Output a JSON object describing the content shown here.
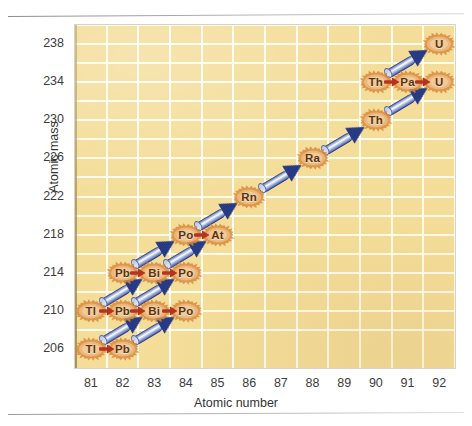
{
  "figure": {
    "background_color": "#f4dd99",
    "grid_color": "#fffdf2",
    "alpha_arrow_color": "#263b84",
    "beta_arrow_color": "#b5331f",
    "nuclide_color": "#5a3316",
    "burst_color": "#d98a3c"
  },
  "chart_data": {
    "type": "scatter",
    "title": "",
    "xlabel": "Atomic number",
    "ylabel": "Atomic mass",
    "xlim": [
      80.5,
      92.5
    ],
    "ylim": [
      204,
      240
    ],
    "grid": true,
    "legend": "none",
    "xticks": [
      81,
      82,
      83,
      84,
      85,
      86,
      87,
      88,
      89,
      90,
      91,
      92
    ],
    "yticks": [
      206,
      210,
      214,
      218,
      222,
      226,
      230,
      234,
      238
    ],
    "nuclides": [
      {
        "label": "U",
        "atomic_number": 92,
        "atomic_mass": 238
      },
      {
        "label": "Th",
        "atomic_number": 90,
        "atomic_mass": 234
      },
      {
        "label": "Pa",
        "atomic_number": 91,
        "atomic_mass": 234
      },
      {
        "label": "U",
        "atomic_number": 92,
        "atomic_mass": 234
      },
      {
        "label": "Th",
        "atomic_number": 90,
        "atomic_mass": 230
      },
      {
        "label": "Ra",
        "atomic_number": 88,
        "atomic_mass": 226
      },
      {
        "label": "Rn",
        "atomic_number": 86,
        "atomic_mass": 222
      },
      {
        "label": "Po",
        "atomic_number": 84,
        "atomic_mass": 218
      },
      {
        "label": "At",
        "atomic_number": 85,
        "atomic_mass": 218
      },
      {
        "label": "Pb",
        "atomic_number": 82,
        "atomic_mass": 214
      },
      {
        "label": "Bi",
        "atomic_number": 83,
        "atomic_mass": 214
      },
      {
        "label": "Po",
        "atomic_number": 84,
        "atomic_mass": 214
      },
      {
        "label": "Tl",
        "atomic_number": 81,
        "atomic_mass": 210
      },
      {
        "label": "Pb",
        "atomic_number": 82,
        "atomic_mass": 210
      },
      {
        "label": "Bi",
        "atomic_number": 83,
        "atomic_mass": 210
      },
      {
        "label": "Po",
        "atomic_number": 84,
        "atomic_mass": 210
      },
      {
        "label": "Tl",
        "atomic_number": 81,
        "atomic_mass": 206
      },
      {
        "label": "Pb",
        "atomic_number": 82,
        "atomic_mass": 206
      }
    ],
    "alpha_decays": [
      {
        "from_z": 92,
        "from_a": 238,
        "to_z": 90,
        "to_a": 234
      },
      {
        "from_z": 92,
        "from_a": 234,
        "to_z": 90,
        "to_a": 230
      },
      {
        "from_z": 90,
        "from_a": 230,
        "to_z": 88,
        "to_a": 226
      },
      {
        "from_z": 88,
        "from_a": 226,
        "to_z": 86,
        "to_a": 222
      },
      {
        "from_z": 86,
        "from_a": 222,
        "to_z": 84,
        "to_a": 218
      },
      {
        "from_z": 84,
        "from_a": 218,
        "to_z": 82,
        "to_a": 214
      },
      {
        "from_z": 85,
        "from_a": 218,
        "to_z": 83,
        "to_a": 214
      },
      {
        "from_z": 84,
        "from_a": 214,
        "to_z": 82,
        "to_a": 210
      },
      {
        "from_z": 83,
        "from_a": 214,
        "to_z": 81,
        "to_a": 210
      },
      {
        "from_z": 84,
        "from_a": 210,
        "to_z": 82,
        "to_a": 206
      },
      {
        "from_z": 83,
        "from_a": 210,
        "to_z": 81,
        "to_a": 206
      }
    ],
    "beta_decays": [
      {
        "from_z": 90,
        "from_a": 234,
        "to_z": 91,
        "to_a": 234
      },
      {
        "from_z": 91,
        "from_a": 234,
        "to_z": 92,
        "to_a": 234
      },
      {
        "from_z": 84,
        "from_a": 218,
        "to_z": 85,
        "to_a": 218
      },
      {
        "from_z": 82,
        "from_a": 214,
        "to_z": 83,
        "to_a": 214
      },
      {
        "from_z": 83,
        "from_a": 214,
        "to_z": 84,
        "to_a": 214
      },
      {
        "from_z": 81,
        "from_a": 210,
        "to_z": 82,
        "to_a": 210
      },
      {
        "from_z": 82,
        "from_a": 210,
        "to_z": 83,
        "to_a": 210
      },
      {
        "from_z": 83,
        "from_a": 210,
        "to_z": 84,
        "to_a": 210
      },
      {
        "from_z": 81,
        "from_a": 206,
        "to_z": 82,
        "to_a": 206
      }
    ]
  }
}
